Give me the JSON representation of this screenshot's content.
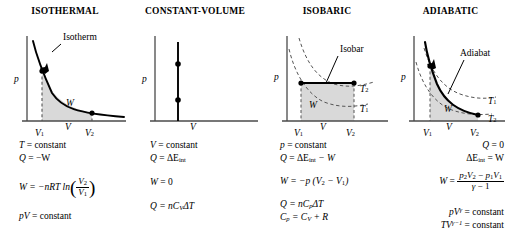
{
  "panels": [
    {
      "title": "ISOTHERMAL",
      "curve_label": "Isotherm",
      "axis_y": "p",
      "axis_x_ticks": [
        "V",
        "V",
        "V"
      ],
      "tick_subs": [
        "1",
        "",
        "2"
      ],
      "work_label": "W",
      "equations": {
        "l1a": "T",
        "l1b": "= constant",
        "l2a": "Q",
        "l2b": "= −W",
        "l3a": "W",
        "l3b": "= −nRT ln",
        "frac_num": "V",
        "frac_num_sub": "2",
        "frac_den": "V",
        "frac_den_sub": "1",
        "l4a": "pV",
        "l4b": "= constant"
      }
    },
    {
      "title": "CONSTANT-VOLUME",
      "curve_label": "",
      "axis_y": "p",
      "axis_x_ticks": [
        "V"
      ],
      "tick_subs": [
        ""
      ],
      "work_label": "",
      "equations": {
        "l1a": "V",
        "l1b": "= constant",
        "l2a": "Q",
        "l2b": "= ΔE",
        "l2sub": "int",
        "l3a": "W",
        "l3b": "= 0",
        "l4a": "Q",
        "l4b": "= nC",
        "l4sub": "V",
        "l4c": "ΔT"
      }
    },
    {
      "title": "ISOBARIC",
      "curve_label": "Isobar",
      "axis_y": "p",
      "axis_x_ticks": [
        "V",
        "V",
        "V"
      ],
      "tick_subs": [
        "1",
        "",
        "2"
      ],
      "work_label": "W",
      "iso_labels": [
        "T",
        "T"
      ],
      "iso_subs": [
        "2",
        "1"
      ],
      "equations": {
        "l1a": "p",
        "l1b": "= constant",
        "l2a": "Q",
        "l2b": "= ΔE",
        "l2sub": "int",
        "l2c": "− W",
        "l3a": "W",
        "l3b": "= −p (V",
        "l3sub1": "2",
        "l3c": "− V",
        "l3sub2": "1",
        "l3d": ")",
        "l4a": "Q",
        "l4b": "= nC",
        "l4sub": "p",
        "l4c": "ΔT",
        "l5a": "C",
        "l5sub1": "p",
        "l5b": "= C",
        "l5sub2": "V",
        "l5c": "+ R"
      }
    },
    {
      "title": "ADIABATIC",
      "curve_label": "Adiabat",
      "axis_y": "p",
      "axis_x_ticks": [
        "V",
        "V",
        "V"
      ],
      "tick_subs": [
        "1",
        "",
        "2"
      ],
      "work_label": "W",
      "iso_labels": [
        "T",
        "T"
      ],
      "iso_subs": [
        "1",
        "2"
      ],
      "equations": {
        "l1a": "Q",
        "l1b": "= 0",
        "l2a": "ΔE",
        "l2sub": "int",
        "l2b": "= W",
        "l3a": "W",
        "l3b": "=",
        "frac_num_a": "p",
        "frac_num_sub_a": "2",
        "frac_num_b": "V",
        "frac_num_sub_b": "2",
        "frac_num_op": "−",
        "frac_num_c": "p",
        "frac_num_sub_c": "1",
        "frac_num_d": "V",
        "frac_num_sub_d": "1",
        "frac_den_a": "γ",
        "frac_den_b": "− 1",
        "l4a": "pV",
        "l4sup": "γ",
        "l4b": "= constant",
        "l5a": "TV",
        "l5sup": "γ−1",
        "l5b": "= constant"
      }
    }
  ],
  "colors": {
    "shade": "#d9d9d9",
    "line": "#000000",
    "axis": "#4a4a4a",
    "dashed": "#555555"
  }
}
